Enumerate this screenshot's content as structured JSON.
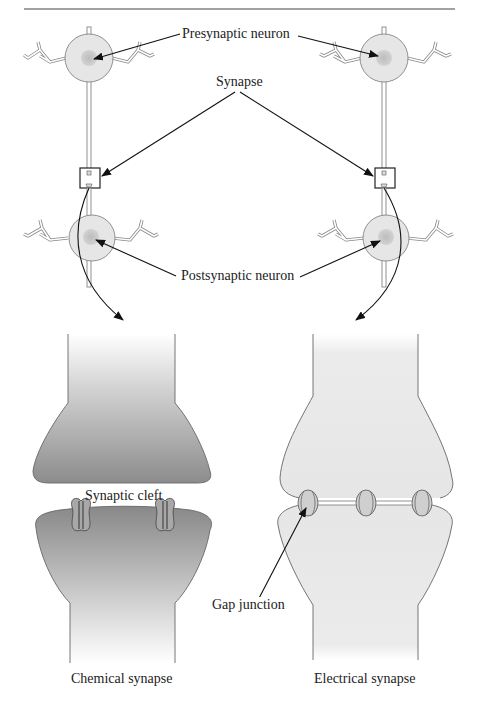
{
  "diagram": {
    "labels": {
      "presynaptic": "Presynaptic neuron",
      "synapse": "Synapse",
      "postsynaptic": "Postsynaptic neuron",
      "synaptic_cleft": "Synaptic cleft",
      "gap_junction": "Gap junction",
      "chemical": "Chemical synapse",
      "electrical": "Electrical synapse"
    },
    "colors": {
      "soma_fill": "#e6e6e6",
      "nucleus_fill": "#c8c8c8",
      "chemical_dark": "#8a8a8a",
      "electrical_fill": "#e8e8e8",
      "outline": "#555555"
    }
  }
}
